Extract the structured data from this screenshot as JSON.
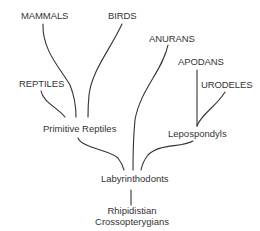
{
  "diagram": {
    "type": "phylogenetic tree",
    "line_color": "#333333",
    "nodes": {
      "mammals": "MAMMALS",
      "birds": "BIRDS",
      "anurans": "ANURANS",
      "apodans": "APODANS",
      "urodeles": "URODELES",
      "reptiles": "REPTILES",
      "primitive_reptiles": "Primitive Reptiles",
      "lepospondyls": "Lepospondyls",
      "labyrinthodonts": "Labyrinthodonts",
      "rhipidistian_line1": "Rhipidistian",
      "rhipidistian_line2": "Crossopterygians"
    },
    "edges": [
      [
        "Primitive Reptiles",
        "MAMMALS"
      ],
      [
        "Primitive Reptiles",
        "BIRDS"
      ],
      [
        "Primitive Reptiles",
        "REPTILES"
      ],
      [
        "Labyrinthodonts",
        "Primitive Reptiles"
      ],
      [
        "Labyrinthodonts",
        "ANURANS"
      ],
      [
        "Labyrinthodonts",
        "Lepospondyls"
      ],
      [
        "Lepospondyls",
        "APODANS"
      ],
      [
        "Lepospondyls",
        "URODELES"
      ],
      [
        "Rhipidistian Crossopterygians",
        "Labyrinthodonts"
      ]
    ]
  }
}
